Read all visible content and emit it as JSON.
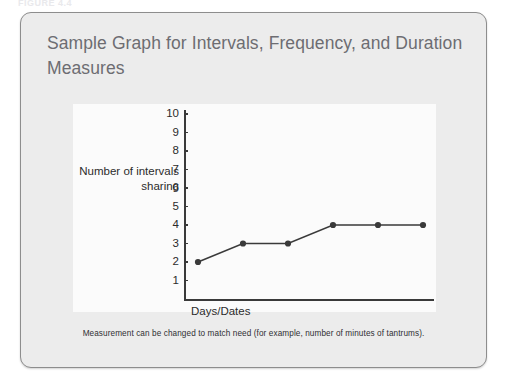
{
  "figure": {
    "label": "FIGURE 4.4",
    "title": "Sample Graph for Intervals, Frequency, and Duration Measures",
    "caption": "Measurement can be changed to match need (for example, number of minutes of tantrums)."
  },
  "colors": {
    "card_background": "#ececec",
    "card_border": "#8d8d8d",
    "panel_background": "#fbfbfb",
    "title_text": "#6d6d72",
    "axis": "#3a3a3a",
    "series": "#3a3a3a"
  },
  "chart_data": {
    "type": "line",
    "title": "",
    "xlabel": "Days/Dates",
    "ylabel": "Number of intervals sharing",
    "x": [
      1,
      2,
      3,
      4,
      5,
      6
    ],
    "values": [
      2,
      3,
      3,
      4,
      4,
      4
    ],
    "categories": [
      "1",
      "2",
      "3",
      "4",
      "5",
      "6"
    ],
    "ytick_labels": [
      "10",
      "9",
      "8",
      "7",
      "6",
      "5",
      "4",
      "3",
      "2",
      "1"
    ],
    "ylim": [
      0,
      10
    ],
    "grid": false,
    "legend": false,
    "marker": "circle"
  }
}
